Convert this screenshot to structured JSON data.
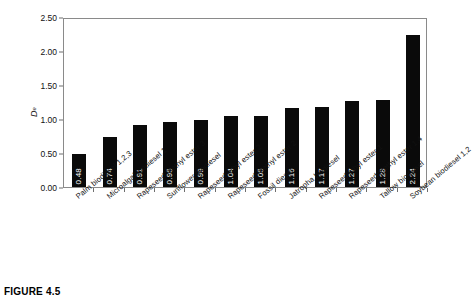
{
  "caption": "FIGURE 4.5",
  "chart_data": {
    "type": "bar",
    "title": "",
    "xlabel": "",
    "ylabel": "De",
    "ylabel_base": "D",
    "ylabel_sub": "e",
    "ylim": [
      0.0,
      2.5
    ],
    "ytick_step": 0.5,
    "ytick_labels": [
      "0.00",
      "0.50",
      "1.00",
      "1.50",
      "2.00",
      "2.50"
    ],
    "ytick_values": [
      0.0,
      0.5,
      1.0,
      1.5,
      2.0,
      2.5
    ],
    "grid": false,
    "legend": "none",
    "bar_color": "#0a0a0a",
    "value_label_color": "#ffffff",
    "frame_color": "#8a8a8a",
    "categories": [
      "Palm biodiesel 1,2,3",
      "Microalgal biodiesel 1",
      "Rapeseed methyl ester 3",
      "Sunflower biodiesel",
      "Rapeseed ethyl ester 2",
      "Rapeseed methyl ester 2",
      "Fossil diesel",
      "Jatropha biodiesel",
      "Rapeseed ethyl ester 1",
      "Rapeseed methyl ester 1,4",
      "Tallow biodiesel",
      "Soybean biodiesel 1,2"
    ],
    "values": [
      0.48,
      0.74,
      0.91,
      0.95,
      0.99,
      1.04,
      1.05,
      1.16,
      1.17,
      1.27,
      1.28,
      2.24
    ],
    "value_labels": [
      "0.48",
      "0.74",
      "0.91",
      "0.95",
      "0.99",
      "1.04",
      "1.05",
      "1.16",
      "1.17",
      "1.27",
      "1.28",
      "2.24"
    ]
  }
}
